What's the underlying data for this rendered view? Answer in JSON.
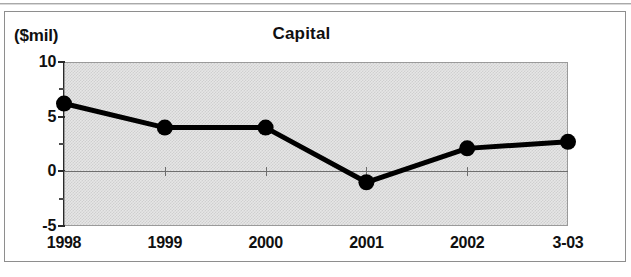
{
  "figure": {
    "axis_unit_label": "($mil)",
    "title": "Capital"
  },
  "chart_data": {
    "type": "line",
    "title": "Capital",
    "xlabel": "",
    "ylabel": "($mil)",
    "categories": [
      "1998",
      "1999",
      "2000",
      "2001",
      "2002",
      "3-03"
    ],
    "values": [
      6.2,
      4.0,
      4.0,
      -1.0,
      2.1,
      2.7
    ],
    "series": [
      {
        "name": "Capital",
        "values": [
          6.2,
          4.0,
          4.0,
          -1.0,
          2.1,
          2.7
        ]
      }
    ],
    "ylim": [
      -5,
      10
    ],
    "y_ticks": [
      10,
      5,
      0,
      -5
    ],
    "y_tick_labels": [
      "10",
      "5",
      "0",
      "-5"
    ],
    "y_minor_ticks": [
      7.5,
      2.5,
      -2.5
    ],
    "grid": false,
    "legend": null,
    "zero_line": true,
    "marker": "filled-circle",
    "line_color": "#000000",
    "plot_background": "#d8d8d8"
  },
  "colors": {
    "line": "#000000",
    "marker": "#000000",
    "plot_fill": "#d8d8d8",
    "frame": "#8e8e8e",
    "axis": "#2a2a2a"
  }
}
